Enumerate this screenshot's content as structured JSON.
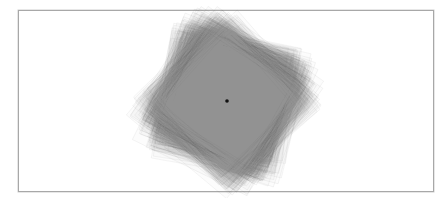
{
  "figure": {
    "frame": {
      "x": 18,
      "y": 10,
      "width": 416,
      "height": 182,
      "border_color": "#a8a8a8"
    },
    "artwork": {
      "description": "Overlapping rotated square outlines forming a dense grey mass",
      "center": [
        227,
        101
      ],
      "shape": "square",
      "count": 140,
      "base_size": 118,
      "size_jitter": 26,
      "rotation_start_deg": 8,
      "rotation_span_deg": 42,
      "offset_jitter": 14,
      "stroke_color": "#5a5a5a",
      "stroke_opacity": 0.1,
      "fill_color": "#8c8c8c",
      "fill_opacity": 0.028,
      "center_dot": {
        "cx": 227,
        "cy": 101,
        "r": 1.8,
        "color": "#111111"
      }
    }
  }
}
